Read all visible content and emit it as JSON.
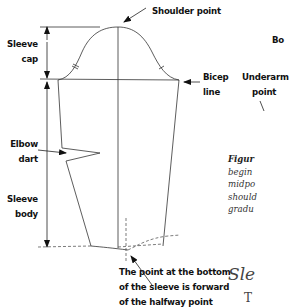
{
  "diagram": {
    "labels": {
      "shoulder_point": "Shoulder point",
      "sleeve_cap_1": "Sleeve",
      "sleeve_cap_2": "cap",
      "bicep_line_1": "Bicep",
      "bicep_line_2": "line",
      "elbow_dart_1": "Elbow",
      "elbow_dart_2": "dart",
      "sleeve_body_1": "Sleeve",
      "sleeve_body_2": "body",
      "bottom_note_1": "The point at the bottom",
      "bottom_note_2": "of the sleeve is forward",
      "bottom_note_3": "of the halfway point"
    },
    "second_figure": {
      "label_top": "Bo",
      "underarm_1": "Underarm",
      "underarm_2": "point"
    },
    "caption": {
      "line1": "Figur",
      "line2": "begin",
      "line3": "midpo",
      "line4": "should",
      "line5": "gradu"
    },
    "section_heading": "Sle",
    "body_text_start": "T"
  }
}
